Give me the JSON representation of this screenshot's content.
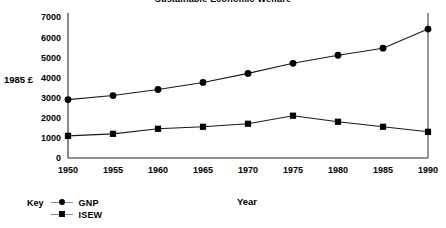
{
  "chart_data": {
    "type": "line",
    "title": "Sustainable Economic Welfare",
    "xlabel": "Year",
    "ylabel": "1985 £",
    "x": [
      1950,
      1955,
      1960,
      1965,
      1970,
      1975,
      1980,
      1985,
      1990
    ],
    "xtick_labels": [
      "1950",
      "1955",
      "1960",
      "1965",
      "1970",
      "1975",
      "1980",
      "1985",
      "1990"
    ],
    "xlim": [
      1950,
      1990
    ],
    "ytick_labels": [
      "0",
      "1000",
      "2000",
      "3000",
      "4000",
      "5000",
      "6000",
      "7000"
    ],
    "yticks": [
      0,
      1000,
      2000,
      3000,
      4000,
      5000,
      6000,
      7000
    ],
    "ylim": [
      0,
      7000
    ],
    "grid": false,
    "legend_title": "Key",
    "legend_position": "bottom-left",
    "series": [
      {
        "name": "GNP",
        "marker": "circle",
        "values": [
          2900,
          3100,
          3400,
          3750,
          4200,
          4700,
          5100,
          5450,
          6400
        ]
      },
      {
        "name": "ISEW",
        "marker": "square",
        "values": [
          1100,
          1200,
          1450,
          1550,
          1700,
          2100,
          1800,
          1550,
          1300
        ]
      }
    ]
  },
  "legend": {
    "key_label": "Key",
    "entries": [
      {
        "name": "GNP",
        "marker": "circle"
      },
      {
        "name": "ISEW",
        "marker": "square"
      }
    ]
  },
  "axes": {
    "y_axis_caption": "1985 £",
    "x_axis_caption": "Year"
  }
}
